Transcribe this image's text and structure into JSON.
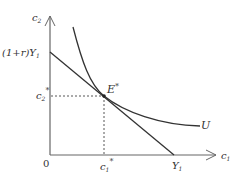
{
  "diagram": {
    "axes": {
      "y_label": "c",
      "y_sub": "2",
      "x_label": "c",
      "x_sub": "1",
      "origin": "0"
    },
    "budget_line": {
      "y_intercept_label": "(1+r)Y",
      "y_intercept_sub": "1",
      "x_intercept_label": "Y",
      "x_intercept_sub": "1"
    },
    "equilibrium": {
      "label": "E",
      "sup": "*",
      "c2_label": "c",
      "c2_sub": "2",
      "c2_sup": "*",
      "c1_label": "c",
      "c1_sub": "1",
      "c1_sup": "*"
    },
    "indifference_curve": {
      "label": "U"
    },
    "colors": {
      "line": "#333333",
      "axis": "#555555"
    }
  }
}
